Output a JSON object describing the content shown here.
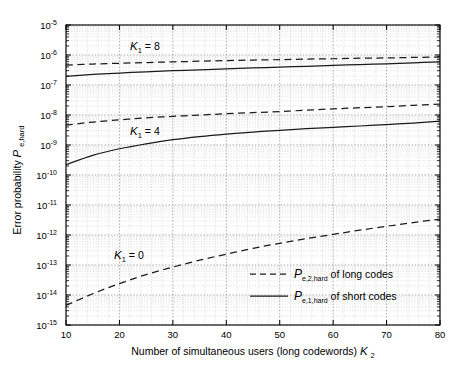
{
  "figure": {
    "background": "#ffffff",
    "axes_color": "#000000",
    "grid_color": "#bfbfbf",
    "line_color": "#1a1a1a"
  },
  "chart_data": {
    "type": "line",
    "title": "",
    "xlabel_parts": {
      "main": "Number of simultaneous users  (long codewords)",
      "symbol": "K",
      "symbol_sub": "2"
    },
    "ylabel_parts": {
      "main": "Error probability",
      "symbol": "P",
      "symbol_sub": "e,hard"
    },
    "xscale": "linear",
    "yscale": "log",
    "xlim": [
      10,
      80
    ],
    "ylim": [
      1e-15,
      1e-05
    ],
    "xticks": [
      10,
      20,
      30,
      40,
      50,
      60,
      70,
      80
    ],
    "xticklabels": [
      "10",
      "20",
      "30",
      "40",
      "50",
      "60",
      "70",
      "80"
    ],
    "yticks": [
      1e-05,
      1e-06,
      1e-07,
      1e-08,
      1e-09,
      1e-10,
      1e-11,
      1e-12,
      1e-13,
      1e-14,
      1e-15
    ],
    "yticklabels": [
      "10^-5",
      "10^-6",
      "10^-7",
      "10^-8",
      "10^-9",
      "10^-10",
      "10^-11",
      "10^-12",
      "10^-13",
      "10^-14",
      "10^-15"
    ],
    "ytick_exponents": [
      "-5",
      "-6",
      "-7",
      "-8",
      "-9",
      "-10",
      "-11",
      "-12",
      "-13",
      "-14",
      "-15"
    ],
    "ytick_mantissa": "10",
    "grid": true,
    "grid_minor": true,
    "legend_position": "lower right",
    "annotations": [
      {
        "name": "k1-8-label",
        "text_symbol": "K",
        "text_sub": "1",
        "text_rest": "= 8",
        "x": 22,
        "y": 1.45e-06
      },
      {
        "name": "k1-4-label",
        "text_symbol": "K",
        "text_sub": "1",
        "text_rest": "= 4",
        "x": 22,
        "y": 2.2e-09
      },
      {
        "name": "k1-0-label",
        "text_symbol": "K",
        "text_sub": "1",
        "text_rest": "= 0",
        "x": 19,
        "y": 1.6e-13
      }
    ],
    "series": [
      {
        "name": "K1=8 long codes",
        "style": "dashed",
        "group": "P_e,2,hard",
        "x": [
          10,
          15,
          20,
          25,
          30,
          35,
          40,
          45,
          50,
          55,
          60,
          65,
          70,
          75,
          80
        ],
        "y": [
          4.6e-07,
          5e-07,
          5.3e-07,
          5.6e-07,
          5.9e-07,
          6.2e-07,
          6.5e-07,
          6.8e-07,
          7e-07,
          7.3e-07,
          7.5e-07,
          7.8e-07,
          8e-07,
          8.3e-07,
          8.6e-07
        ]
      },
      {
        "name": "K1=8 short codes",
        "style": "solid",
        "group": "P_e,1,hard",
        "x": [
          10,
          15,
          20,
          25,
          30,
          35,
          40,
          45,
          50,
          55,
          60,
          65,
          70,
          75,
          80
        ],
        "y": [
          1.95e-07,
          2.25e-07,
          2.5e-07,
          2.75e-07,
          3e-07,
          3.2e-07,
          3.45e-07,
          3.7e-07,
          3.95e-07,
          4.2e-07,
          4.5e-07,
          4.8e-07,
          5.1e-07,
          5.5e-07,
          5.9e-07
        ]
      },
      {
        "name": "K1=4 long codes",
        "style": "dashed",
        "group": "P_e,2,hard",
        "x": [
          10,
          15,
          20,
          25,
          30,
          35,
          40,
          45,
          50,
          55,
          60,
          65,
          70,
          75,
          80
        ],
        "y": [
          4.6e-09,
          5.8e-09,
          6.9e-09,
          8e-09,
          9e-09,
          1e-08,
          1.1e-08,
          1.2e-08,
          1.3e-08,
          1.45e-08,
          1.6e-08,
          1.75e-08,
          1.9e-08,
          2.1e-08,
          2.3e-08
        ]
      },
      {
        "name": "K1=4 short codes",
        "style": "solid",
        "group": "P_e,1,hard",
        "x": [
          10,
          15,
          20,
          25,
          30,
          35,
          40,
          45,
          50,
          55,
          60,
          65,
          70,
          75,
          80
        ],
        "y": [
          2.2e-10,
          4.5e-10,
          7.5e-10,
          1.1e-09,
          1.5e-09,
          1.9e-09,
          2.3e-09,
          2.7e-09,
          3.1e-09,
          3.5e-09,
          3.9e-09,
          4.3e-09,
          4.8e-09,
          5.4e-09,
          6.2e-09
        ]
      },
      {
        "name": "K1=0 long codes",
        "style": "dashed",
        "group": "P_e,2,hard",
        "x": [
          10,
          15,
          20,
          25,
          30,
          35,
          40,
          45,
          50,
          55,
          60,
          65,
          70,
          75,
          80
        ],
        "y": [
          4.5e-15,
          1.1e-14,
          2.4e-14,
          4.8e-14,
          8.5e-14,
          1.45e-13,
          2.3e-13,
          3.6e-13,
          5.3e-13,
          7.6e-13,
          1.05e-12,
          1.45e-12,
          1.95e-12,
          2.6e-12,
          3.4e-12
        ]
      }
    ],
    "legend": [
      {
        "name": "legend-long-codes",
        "style": "dashed",
        "symbol": "P",
        "symbol_sub": "e,2,hard",
        "text": "of long codes"
      },
      {
        "name": "legend-short-codes",
        "style": "solid",
        "symbol": "P",
        "symbol_sub": "e,1,hard",
        "text": "of short codes"
      }
    ]
  }
}
